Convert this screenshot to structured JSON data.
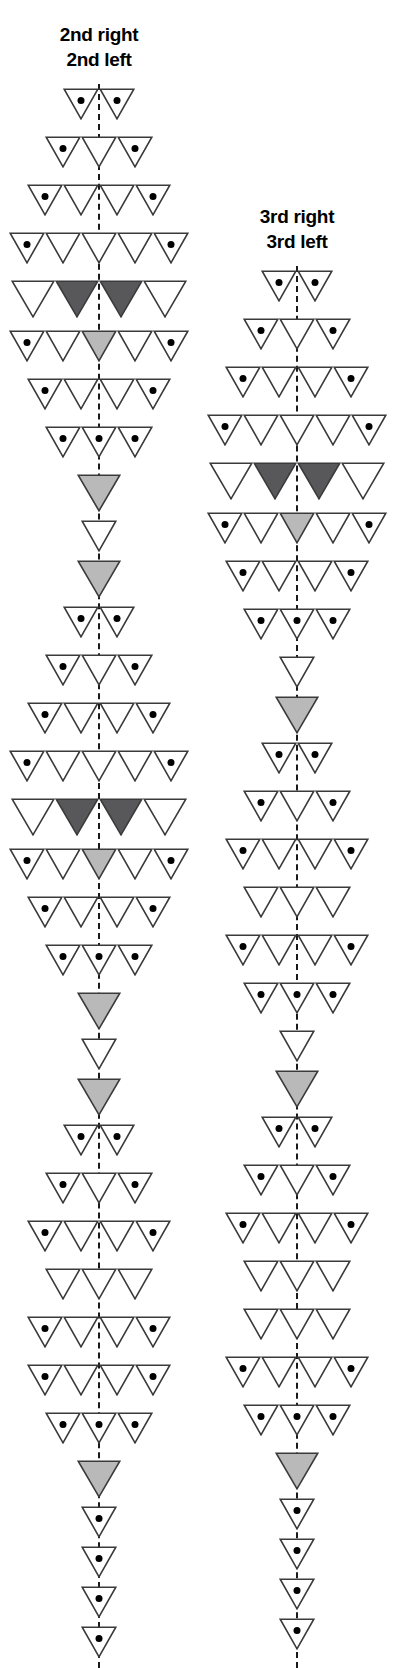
{
  "figure": {
    "background": "#ffffff",
    "stroke_color": "#3a3a3a",
    "dark_fill": "#58585a",
    "light_fill": "#b9b9b9",
    "dot_color": "#000000",
    "axis_color": "#1a1a1a"
  },
  "columns": [
    {
      "id": "second",
      "caption_line1": "2nd right",
      "caption_line2": "2nd left",
      "axis": {
        "top": 84,
        "bottom": 1668
      },
      "rows": [
        {
          "y": 88,
          "cells": [
            "dot",
            "dot"
          ]
        },
        {
          "y": 136,
          "cells": [
            "dot",
            "empty",
            "dot"
          ]
        },
        {
          "y": 184,
          "cells": [
            "dot",
            "empty",
            "empty",
            "dot"
          ]
        },
        {
          "y": 232,
          "cells": [
            "dot",
            "empty",
            "empty",
            "empty",
            "dot"
          ]
        },
        {
          "y": 280,
          "cells": [
            "empty",
            "dark",
            "dark",
            "empty"
          ],
          "big": true
        },
        {
          "y": 330,
          "cells": [
            "dot",
            "empty",
            "light",
            "empty",
            "dot"
          ]
        },
        {
          "y": 378,
          "cells": [
            "dot",
            "empty",
            "empty",
            "dot"
          ]
        },
        {
          "y": 426,
          "cells": [
            "dot",
            "dot",
            "dot"
          ]
        },
        {
          "y": 474,
          "cells": [
            "light"
          ],
          "big": true
        },
        {
          "y": 520,
          "cells": [
            "empty"
          ]
        },
        {
          "y": 560,
          "cells": [
            "light"
          ],
          "big": true
        },
        {
          "y": 606,
          "cells": [
            "dot",
            "dot"
          ]
        },
        {
          "y": 654,
          "cells": [
            "dot",
            "empty",
            "dot"
          ]
        },
        {
          "y": 702,
          "cells": [
            "dot",
            "empty",
            "empty",
            "dot"
          ]
        },
        {
          "y": 750,
          "cells": [
            "dot",
            "empty",
            "empty",
            "empty",
            "dot"
          ]
        },
        {
          "y": 798,
          "cells": [
            "empty",
            "dark",
            "dark",
            "empty"
          ],
          "big": true
        },
        {
          "y": 848,
          "cells": [
            "dot",
            "empty",
            "light",
            "empty",
            "dot"
          ]
        },
        {
          "y": 896,
          "cells": [
            "dot",
            "empty",
            "empty",
            "dot"
          ]
        },
        {
          "y": 944,
          "cells": [
            "dot",
            "dot",
            "dot"
          ]
        },
        {
          "y": 992,
          "cells": [
            "light"
          ],
          "big": true
        },
        {
          "y": 1038,
          "cells": [
            "empty"
          ]
        },
        {
          "y": 1078,
          "cells": [
            "light"
          ],
          "big": true
        },
        {
          "y": 1124,
          "cells": [
            "dot",
            "dot"
          ]
        },
        {
          "y": 1172,
          "cells": [
            "dot",
            "empty",
            "dot"
          ]
        },
        {
          "y": 1220,
          "cells": [
            "dot",
            "empty",
            "empty",
            "dot"
          ]
        },
        {
          "y": 1268,
          "cells": [
            "empty",
            "empty",
            "empty"
          ]
        },
        {
          "y": 1316,
          "cells": [
            "dot",
            "empty",
            "empty",
            "dot"
          ]
        },
        {
          "y": 1364,
          "cells": [
            "dot",
            "empty",
            "empty",
            "dot"
          ]
        },
        {
          "y": 1412,
          "cells": [
            "dot",
            "dot",
            "dot"
          ]
        },
        {
          "y": 1460,
          "cells": [
            "light"
          ],
          "big": true
        },
        {
          "y": 1506,
          "cells": [
            "dot"
          ]
        },
        {
          "y": 1546,
          "cells": [
            "dot"
          ]
        },
        {
          "y": 1586,
          "cells": [
            "dot"
          ]
        },
        {
          "y": 1626,
          "cells": [
            "dot"
          ]
        }
      ]
    },
    {
      "id": "third",
      "caption_line1": "3rd right",
      "caption_line2": "3rd left",
      "axis": {
        "top": 266,
        "bottom": 1668
      },
      "rows": [
        {
          "y": 270,
          "cells": [
            "dot",
            "dot"
          ]
        },
        {
          "y": 318,
          "cells": [
            "dot",
            "empty",
            "dot"
          ]
        },
        {
          "y": 366,
          "cells": [
            "dot",
            "empty",
            "empty",
            "dot"
          ]
        },
        {
          "y": 414,
          "cells": [
            "dot",
            "empty",
            "empty",
            "empty",
            "dot"
          ]
        },
        {
          "y": 462,
          "cells": [
            "empty",
            "dark",
            "dark",
            "empty"
          ],
          "big": true
        },
        {
          "y": 512,
          "cells": [
            "dot",
            "empty",
            "light",
            "empty",
            "dot"
          ]
        },
        {
          "y": 560,
          "cells": [
            "dot",
            "empty",
            "empty",
            "dot"
          ]
        },
        {
          "y": 608,
          "cells": [
            "dot",
            "dot",
            "dot"
          ]
        },
        {
          "y": 656,
          "cells": [
            "empty"
          ]
        },
        {
          "y": 696,
          "cells": [
            "light"
          ],
          "big": true
        },
        {
          "y": 742,
          "cells": [
            "dot",
            "dot"
          ]
        },
        {
          "y": 790,
          "cells": [
            "dot",
            "empty",
            "dot"
          ]
        },
        {
          "y": 838,
          "cells": [
            "dot",
            "empty",
            "empty",
            "dot"
          ]
        },
        {
          "y": 886,
          "cells": [
            "empty",
            "empty",
            "empty"
          ]
        },
        {
          "y": 934,
          "cells": [
            "dot",
            "empty",
            "empty",
            "dot"
          ]
        },
        {
          "y": 982,
          "cells": [
            "dot",
            "dot",
            "dot"
          ]
        },
        {
          "y": 1030,
          "cells": [
            "empty"
          ]
        },
        {
          "y": 1070,
          "cells": [
            "light"
          ],
          "big": true
        },
        {
          "y": 1116,
          "cells": [
            "dot",
            "dot"
          ]
        },
        {
          "y": 1164,
          "cells": [
            "dot",
            "empty",
            "dot"
          ]
        },
        {
          "y": 1212,
          "cells": [
            "dot",
            "empty",
            "empty",
            "dot"
          ]
        },
        {
          "y": 1260,
          "cells": [
            "empty",
            "empty",
            "empty"
          ]
        },
        {
          "y": 1308,
          "cells": [
            "empty",
            "empty",
            "empty"
          ]
        },
        {
          "y": 1356,
          "cells": [
            "dot",
            "empty",
            "empty",
            "dot"
          ]
        },
        {
          "y": 1404,
          "cells": [
            "dot",
            "dot",
            "dot"
          ]
        },
        {
          "y": 1452,
          "cells": [
            "light"
          ],
          "big": true
        },
        {
          "y": 1498,
          "cells": [
            "dot"
          ]
        },
        {
          "y": 1538,
          "cells": [
            "dot"
          ]
        },
        {
          "y": 1578,
          "cells": [
            "dot"
          ]
        },
        {
          "y": 1618,
          "cells": [
            "dot"
          ]
        }
      ]
    }
  ]
}
